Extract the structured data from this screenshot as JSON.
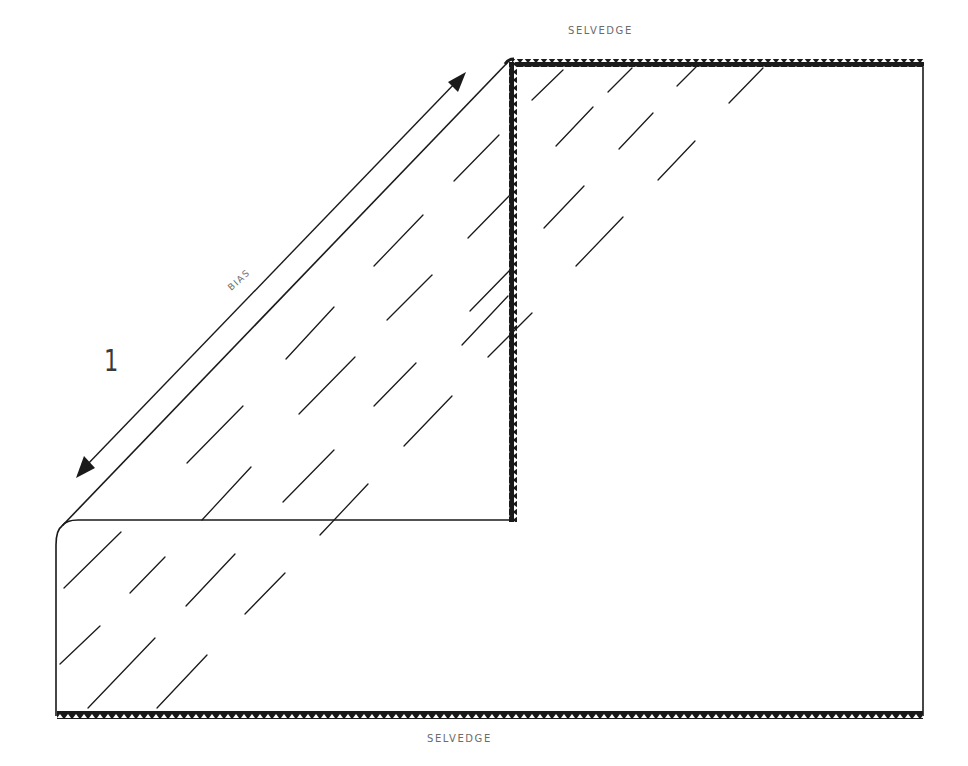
{
  "diagram": {
    "step_number": "1",
    "labels": {
      "top_selvedge": "SELVEDGE",
      "bottom_selvedge": "SELVEDGE",
      "bias": "BIAS"
    },
    "elements": [
      {
        "name": "fabric-rectangle",
        "description": "Full fabric piece with selvedges on top and bottom edges"
      },
      {
        "name": "folded-triangle",
        "description": "Top-left corner folded down along the bias, leaving a triangle whose vertical edge is a selvedge"
      },
      {
        "name": "bias-arrow",
        "description": "Double-headed arrow parallel to the bias fold"
      },
      {
        "name": "hatching",
        "description": "Diagonal dashes indicating grain direction"
      }
    ],
    "colors": {
      "line": "#1a1a1a",
      "label": "#6b6b6b",
      "background": "#ffffff"
    }
  }
}
